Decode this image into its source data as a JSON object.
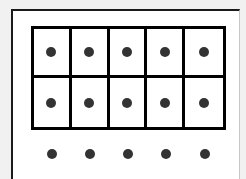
{
  "diagram": {
    "type": "ten-frame",
    "colors": {
      "background": "#f1f1f1",
      "frame_fill": "#ffffff",
      "grid_line": "#000000",
      "dot": "#333333"
    },
    "grid": {
      "rows": 2,
      "columns": 5,
      "cells": [
        [
          true,
          true,
          true,
          true,
          true
        ],
        [
          true,
          true,
          true,
          true,
          true
        ]
      ]
    },
    "loose_dots": {
      "count": 5,
      "x": [
        52,
        90,
        128,
        166,
        205
      ],
      "y": 154
    },
    "totals": {
      "dots_in_grid": 10,
      "dots_outside": 5,
      "total_dots": 15
    }
  }
}
